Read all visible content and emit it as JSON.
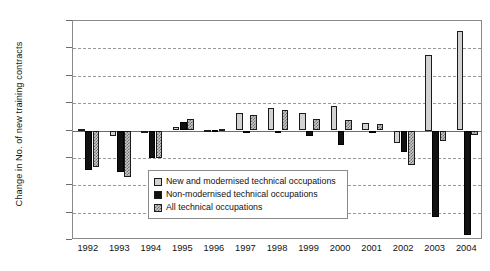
{
  "chart_data": {
    "type": "bar",
    "title": "",
    "subtitle": "",
    "xlabel": "",
    "ylabel": "Change in No. of new training contracts",
    "ylim": [
      -40000,
      40000
    ],
    "ytick_step": 10000,
    "grid": true,
    "grid_style": "dashed horizontal",
    "legend_position": "inside-center-lower",
    "categories": [
      "1992",
      "1993",
      "1994",
      "1995",
      "1996",
      "1997",
      "1998",
      "1999",
      "2000",
      "2001",
      "2002",
      "2003",
      "2004"
    ],
    "ytick_labels": [
      "40,000",
      "30,000",
      "20,000",
      "10,000",
      "0",
      "-10,000",
      "-20,000",
      "-30,000",
      "-40,000"
    ],
    "ytick_values": [
      40000,
      30000,
      20000,
      10000,
      0,
      -10000,
      -20000,
      -30000,
      -40000
    ],
    "series": [
      {
        "name": "New and modernised technical occupations",
        "fill": "light-grey-solid",
        "color": "#d2d2d2",
        "values": [
          700,
          -2000,
          -300,
          1200,
          300,
          6400,
          8200,
          6300,
          9000,
          2600,
          -4600,
          27500,
          36500
        ]
      },
      {
        "name": "Non-modernised technical occupations",
        "fill": "black-solid",
        "color": "#111111",
        "values": [
          -14300,
          -15000,
          -10200,
          3000,
          300,
          -900,
          -700,
          -2000,
          -5200,
          -200,
          -8000,
          -31500,
          -38000
        ]
      },
      {
        "name": "All technical occupations",
        "fill": "grey-checkerboard",
        "color": "#c9c9c9",
        "values": [
          -13500,
          -17000,
          -10200,
          4200,
          600,
          5600,
          7600,
          4300,
          3800,
          2400,
          -12600,
          -4000,
          -1500
        ]
      }
    ]
  },
  "legend": {
    "items": [
      {
        "label": "New and modernised technical occupations",
        "swatch": "light-grey-solid"
      },
      {
        "label": "Non-modernised technical occupations",
        "swatch": "black-solid"
      },
      {
        "label": "All technical occupations",
        "swatch": "grey-checkerboard"
      }
    ]
  }
}
